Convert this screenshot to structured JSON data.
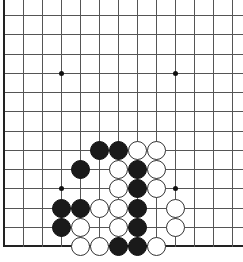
{
  "board": {
    "visible_columns": 13,
    "visible_rows": 13,
    "origin_x": 4,
    "origin_y": 15,
    "spacing_x": 19,
    "spacing_y": 19.25,
    "edges": {
      "left": true,
      "bottom": true,
      "top": false,
      "right": false
    },
    "colors": {
      "line": "#555555",
      "edge": "#222222",
      "black": "#1a1a1a",
      "white": "#ffffff",
      "background": "#ffffff"
    },
    "star_points": [
      {
        "col": 3,
        "row": 3
      },
      {
        "col": 9,
        "row": 3
      },
      {
        "col": 3,
        "row": 9
      },
      {
        "col": 9,
        "row": 9
      }
    ],
    "stones": [
      {
        "color": "black",
        "col": 5,
        "row": 7
      },
      {
        "color": "black",
        "col": 6,
        "row": 7
      },
      {
        "color": "white",
        "col": 7,
        "row": 7
      },
      {
        "color": "white",
        "col": 8,
        "row": 7
      },
      {
        "color": "black",
        "col": 4,
        "row": 8
      },
      {
        "color": "white",
        "col": 6,
        "row": 8
      },
      {
        "color": "black",
        "col": 7,
        "row": 8
      },
      {
        "color": "white",
        "col": 8,
        "row": 8
      },
      {
        "color": "white",
        "col": 6,
        "row": 9
      },
      {
        "color": "black",
        "col": 7,
        "row": 9
      },
      {
        "color": "white",
        "col": 8,
        "row": 9
      },
      {
        "color": "black",
        "col": 3,
        "row": 10
      },
      {
        "color": "black",
        "col": 4,
        "row": 10
      },
      {
        "color": "white",
        "col": 5,
        "row": 10
      },
      {
        "color": "white",
        "col": 6,
        "row": 10
      },
      {
        "color": "black",
        "col": 7,
        "row": 10
      },
      {
        "color": "white",
        "col": 9,
        "row": 10
      },
      {
        "color": "black",
        "col": 3,
        "row": 11
      },
      {
        "color": "white",
        "col": 4,
        "row": 11
      },
      {
        "color": "white",
        "col": 6,
        "row": 11
      },
      {
        "color": "black",
        "col": 7,
        "row": 11
      },
      {
        "color": "white",
        "col": 9,
        "row": 11
      },
      {
        "color": "white",
        "col": 4,
        "row": 12
      },
      {
        "color": "white",
        "col": 5,
        "row": 12
      },
      {
        "color": "black",
        "col": 6,
        "row": 12
      },
      {
        "color": "black",
        "col": 7,
        "row": 12
      },
      {
        "color": "white",
        "col": 8,
        "row": 12
      }
    ]
  }
}
